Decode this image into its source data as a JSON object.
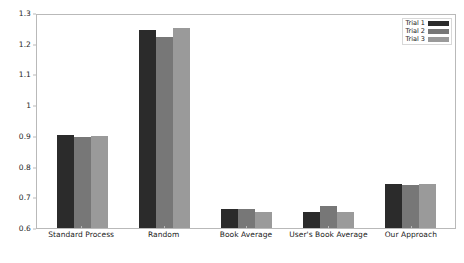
{
  "chart_data": {
    "type": "bar",
    "title": "",
    "xlabel": "",
    "ylabel": "",
    "ylim": [
      0.6,
      1.3
    ],
    "ytick_step": 0.1,
    "grid": false,
    "legend_position": "upper right",
    "categories": [
      "Standard Process",
      "Random",
      "Book Average",
      "User's Book Average",
      "Our Approach"
    ],
    "ytick_labels": [
      "0.6",
      "0.7",
      "0.8",
      "0.9",
      "1",
      "1.1",
      "1.2",
      "1.3"
    ],
    "ytick_values": [
      0.6,
      0.7,
      0.8,
      0.9,
      1.0,
      1.1,
      1.2,
      1.3
    ],
    "series": [
      {
        "name": "Trial 1",
        "color": "#2b2b2b",
        "values": [
          0.905,
          1.25,
          0.663,
          0.651,
          0.746
        ]
      },
      {
        "name": "Trial 2",
        "color": "#777777",
        "values": [
          0.9,
          1.228,
          0.661,
          0.672,
          0.742
        ]
      },
      {
        "name": "Trial 3",
        "color": "#9a9a9a",
        "values": [
          0.902,
          1.257,
          0.651,
          0.652,
          0.744
        ]
      }
    ]
  },
  "axes": {
    "frame_color": "#b9b9b9",
    "background": "#ffffff"
  }
}
